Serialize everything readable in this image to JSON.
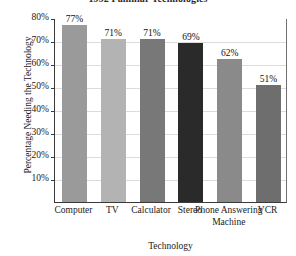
{
  "chart_data": {
    "type": "bar",
    "title": "1992 Familiar Technologies",
    "xlabel": "Technology",
    "ylabel": "Percentage Needing the Technology",
    "categories": [
      "Computer",
      "TV",
      "Calculator",
      "Stereo",
      "Phone Answering Machine",
      "VCR"
    ],
    "values": [
      77,
      71,
      71,
      69,
      62,
      51
    ],
    "value_labels": [
      "77%",
      "71%",
      "71%",
      "69%",
      "62%",
      "51%"
    ],
    "bar_colors": [
      "#9a9a9a",
      "#b3b3b3",
      "#787878",
      "#2a2a2a",
      "#8a8a8a",
      "#6e6e6e"
    ],
    "ylim": [
      0,
      80
    ],
    "ytick_values": [
      80,
      70,
      60,
      50,
      40,
      30,
      20,
      10
    ],
    "ytick_labels": [
      "80%",
      "70%",
      "60%",
      "50%",
      "40%",
      "30%",
      "20%",
      "10%"
    ],
    "grid": true,
    "legend": "none",
    "axis_color": "#3a3a3a",
    "grid_color": "#dcdcdc"
  }
}
